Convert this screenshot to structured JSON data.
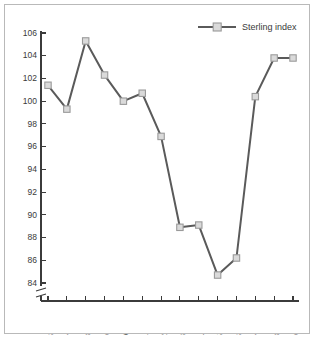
{
  "chart_data": {
    "type": "line",
    "title": "",
    "xlabel": "",
    "ylabel": "",
    "categories": [
      "1986",
      "1987",
      "1988",
      "1989",
      "1990",
      "1991",
      "1992",
      "1993",
      "1994",
      "1995",
      "1996",
      "1997",
      "1998",
      "1999"
    ],
    "series": [
      {
        "name": "Sterling index",
        "values": [
          101.4,
          99.3,
          105.3,
          102.3,
          100.0,
          100.7,
          96.9,
          88.9,
          89.1,
          84.7,
          86.2,
          100.4,
          103.8,
          103.8
        ]
      }
    ],
    "ylim": [
      84,
      106
    ],
    "ytick_labels": [
      "84",
      "86",
      "88",
      "90",
      "92",
      "94",
      "96",
      "98",
      "100",
      "102",
      "104",
      "106"
    ],
    "ytick_values": [
      84,
      86,
      88,
      90,
      92,
      94,
      96,
      98,
      100,
      102,
      104,
      106
    ],
    "y_axis_break": true,
    "grid": false,
    "legend_position": "top-right",
    "marker": "open-square",
    "line_color": "#5a5a5a",
    "marker_fill": "#dadada",
    "marker_stroke": "#9a9a9a",
    "axis_color": "#3b3b3b",
    "background_color": "#ffffff",
    "border_color": "#b9b9b9"
  },
  "legend": {
    "entries": [
      {
        "label": "Sterling index"
      }
    ]
  }
}
